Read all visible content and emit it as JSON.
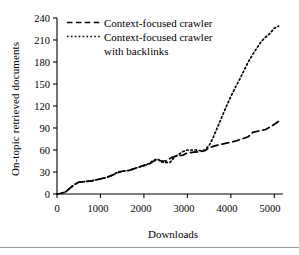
{
  "figure": {
    "background": "#ffffff",
    "ink": "#000000",
    "rule_color": "#9a9a9a"
  },
  "chart_data": {
    "type": "line",
    "title": "",
    "subtitle": "",
    "xlabel": "Downloads",
    "ylabel": "On-topic retrieved documents",
    "xlim": [
      0,
      5200
    ],
    "ylim": [
      0,
      240
    ],
    "xticks": [
      0,
      1000,
      2000,
      3000,
      4000,
      5000
    ],
    "xtick_labels": [
      "0",
      "1000",
      "2000",
      "3000",
      "4000",
      "5000"
    ],
    "yticks": [
      0,
      30,
      60,
      90,
      120,
      150,
      180,
      210,
      240
    ],
    "ytick_labels": [
      "0",
      "30",
      "60",
      "90",
      "120",
      "150",
      "180",
      "210",
      "240"
    ],
    "grid": false,
    "legend_position": "upper-left",
    "annotations": [],
    "series": [
      {
        "name": "Context-focused crawler",
        "linestyle": "dashed",
        "color": "#000000",
        "dash_pattern": "7,4",
        "points": [
          [
            0,
            0
          ],
          [
            100,
            1
          ],
          [
            200,
            3
          ],
          [
            300,
            8
          ],
          [
            400,
            13
          ],
          [
            500,
            16
          ],
          [
            650,
            17
          ],
          [
            800,
            18
          ],
          [
            950,
            20
          ],
          [
            1100,
            22
          ],
          [
            1250,
            25
          ],
          [
            1400,
            29
          ],
          [
            1500,
            31
          ],
          [
            1650,
            32
          ],
          [
            1800,
            35
          ],
          [
            1950,
            38
          ],
          [
            2100,
            40
          ],
          [
            2200,
            44
          ],
          [
            2300,
            47
          ],
          [
            2400,
            45
          ],
          [
            2500,
            45
          ],
          [
            2650,
            50
          ],
          [
            2750,
            52
          ],
          [
            2900,
            53
          ],
          [
            3000,
            56
          ],
          [
            3150,
            57
          ],
          [
            3300,
            58
          ],
          [
            3400,
            59
          ],
          [
            3500,
            63
          ],
          [
            3650,
            66
          ],
          [
            3800,
            68
          ],
          [
            3950,
            70
          ],
          [
            4100,
            72
          ],
          [
            4250,
            75
          ],
          [
            4400,
            78
          ],
          [
            4500,
            84
          ],
          [
            4650,
            86
          ],
          [
            4800,
            88
          ],
          [
            4950,
            93
          ],
          [
            5100,
            99
          ]
        ]
      },
      {
        "name": "Context-focused crawler with backlinks",
        "linestyle": "dotted",
        "color": "#000000",
        "dash_pattern": "1.6,2.6",
        "points": [
          [
            0,
            0
          ],
          [
            100,
            1
          ],
          [
            200,
            3
          ],
          [
            300,
            8
          ],
          [
            400,
            13
          ],
          [
            500,
            16
          ],
          [
            650,
            17
          ],
          [
            800,
            18
          ],
          [
            950,
            20
          ],
          [
            1100,
            22
          ],
          [
            1250,
            25
          ],
          [
            1400,
            30
          ],
          [
            1500,
            31
          ],
          [
            1650,
            32
          ],
          [
            1800,
            35
          ],
          [
            1950,
            38
          ],
          [
            2100,
            41
          ],
          [
            2200,
            45
          ],
          [
            2300,
            48
          ],
          [
            2400,
            44
          ],
          [
            2500,
            43
          ],
          [
            2600,
            43
          ],
          [
            2700,
            50
          ],
          [
            2800,
            54
          ],
          [
            2900,
            58
          ],
          [
            3000,
            60
          ],
          [
            3100,
            60
          ],
          [
            3200,
            60
          ],
          [
            3300,
            59
          ],
          [
            3400,
            60
          ],
          [
            3500,
            66
          ],
          [
            3600,
            78
          ],
          [
            3700,
            92
          ],
          [
            3800,
            106
          ],
          [
            3900,
            120
          ],
          [
            4000,
            133
          ],
          [
            4100,
            145
          ],
          [
            4200,
            156
          ],
          [
            4300,
            168
          ],
          [
            4400,
            180
          ],
          [
            4500,
            190
          ],
          [
            4600,
            199
          ],
          [
            4700,
            208
          ],
          [
            4800,
            214
          ],
          [
            4900,
            219
          ],
          [
            5000,
            226
          ],
          [
            5100,
            229
          ]
        ]
      }
    ]
  },
  "legend": {
    "entries": [
      {
        "label": "Context-focused crawler",
        "style": "dashed"
      },
      {
        "label": "Context-focused crawler",
        "label2": "with backlinks",
        "style": "dotted"
      }
    ]
  }
}
